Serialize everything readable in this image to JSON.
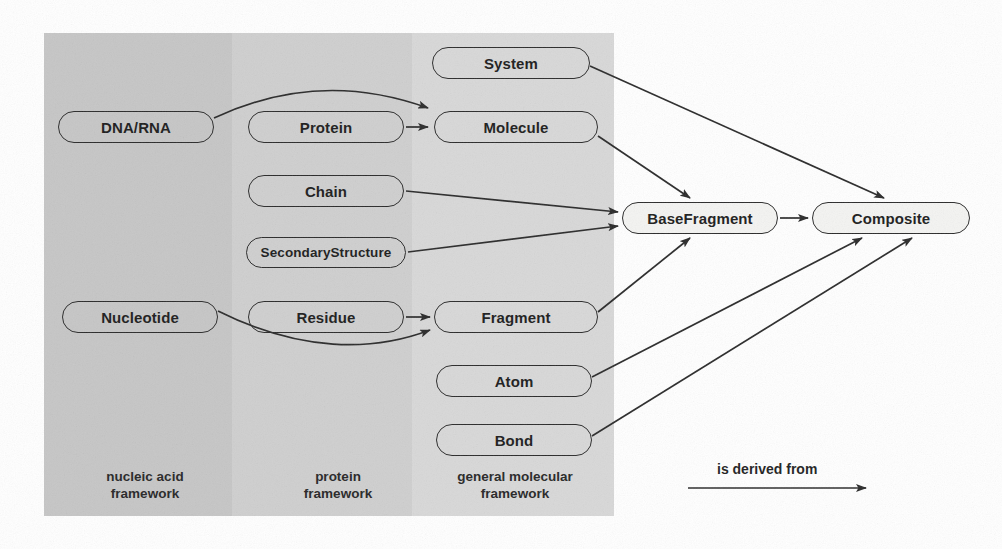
{
  "figure": {
    "kind": "uml-class-hierarchy-diagram",
    "background_color": "#ffffff"
  },
  "bands": [
    {
      "id": "nucleic-acid",
      "label": "nucleic acid\nframework",
      "color": "#c6c6c6",
      "x": 44,
      "y": 33,
      "width": 188,
      "height": 483,
      "label_x": 62,
      "label_y": 468
    },
    {
      "id": "protein",
      "label": "protein\nframework",
      "color": "#cfcfcf",
      "x": 232,
      "y": 33,
      "width": 180,
      "height": 483,
      "label_x": 268,
      "label_y": 468
    },
    {
      "id": "general-molecular",
      "label": "general molecular\nframework",
      "color": "#d8d8d8",
      "x": 412,
      "y": 33,
      "width": 202,
      "height": 483,
      "label_x": 420,
      "label_y": 468
    }
  ],
  "nodes": [
    {
      "id": "system",
      "label": "System",
      "band": "general-molecular",
      "fill": "shaded",
      "x": 432,
      "y": 47,
      "width": 158,
      "height": 32,
      "font_size": 15
    },
    {
      "id": "dna-rna",
      "label": "DNA/RNA",
      "band": "nucleic-acid",
      "fill": "shaded",
      "x": 58,
      "y": 111,
      "width": 156,
      "height": 32,
      "font_size": 15
    },
    {
      "id": "protein",
      "label": "Protein",
      "band": "protein",
      "fill": "shaded",
      "x": 248,
      "y": 111,
      "width": 156,
      "height": 32,
      "font_size": 15
    },
    {
      "id": "molecule",
      "label": "Molecule",
      "band": "general-molecular",
      "fill": "shaded",
      "x": 434,
      "y": 111,
      "width": 164,
      "height": 32,
      "font_size": 15
    },
    {
      "id": "chain",
      "label": "Chain",
      "band": "protein",
      "fill": "shaded",
      "x": 248,
      "y": 175,
      "width": 156,
      "height": 32,
      "font_size": 15
    },
    {
      "id": "secondary-structure",
      "label": "SecondaryStructure",
      "band": "protein",
      "fill": "shaded",
      "x": 246,
      "y": 237,
      "width": 160,
      "height": 31,
      "font_size": 13.5
    },
    {
      "id": "nucleotide",
      "label": "Nucleotide",
      "band": "nucleic-acid",
      "fill": "shaded",
      "x": 62,
      "y": 301,
      "width": 156,
      "height": 32,
      "font_size": 15
    },
    {
      "id": "residue",
      "label": "Residue",
      "band": "protein",
      "fill": "shaded",
      "x": 248,
      "y": 301,
      "width": 156,
      "height": 32,
      "font_size": 15
    },
    {
      "id": "fragment",
      "label": "Fragment",
      "band": "general-molecular",
      "fill": "shaded",
      "x": 434,
      "y": 301,
      "width": 164,
      "height": 32,
      "font_size": 15
    },
    {
      "id": "atom",
      "label": "Atom",
      "band": "general-molecular",
      "fill": "shaded",
      "x": 436,
      "y": 365,
      "width": 156,
      "height": 32,
      "font_size": 15
    },
    {
      "id": "bond",
      "label": "Bond",
      "band": "general-molecular",
      "fill": "shaded",
      "x": 436,
      "y": 424,
      "width": 156,
      "height": 32,
      "font_size": 15
    },
    {
      "id": "base-fragment",
      "label": "BaseFragment",
      "band": null,
      "fill": "white",
      "x": 622,
      "y": 202,
      "width": 156,
      "height": 32,
      "font_size": 15
    },
    {
      "id": "composite",
      "label": "Composite",
      "band": null,
      "fill": "white",
      "x": 812,
      "y": 202,
      "width": 158,
      "height": 32,
      "font_size": 15
    }
  ],
  "edges": [
    {
      "id": "dna-rna-to-molecule",
      "from": "dna-rna",
      "to": "molecule",
      "style": "curved"
    },
    {
      "id": "protein-to-molecule",
      "from": "protein",
      "to": "molecule",
      "style": "straight"
    },
    {
      "id": "chain-to-base-fragment",
      "from": "chain",
      "to": "base-fragment",
      "style": "straight"
    },
    {
      "id": "secondary-structure-to-base-fragment",
      "from": "secondary-structure",
      "to": "base-fragment",
      "style": "straight"
    },
    {
      "id": "nucleotide-to-fragment",
      "from": "nucleotide",
      "to": "fragment",
      "style": "curved"
    },
    {
      "id": "residue-to-fragment",
      "from": "residue",
      "to": "fragment",
      "style": "straight"
    },
    {
      "id": "system-to-composite",
      "from": "system",
      "to": "composite",
      "style": "straight"
    },
    {
      "id": "molecule-to-base-fragment",
      "from": "molecule",
      "to": "base-fragment",
      "style": "straight"
    },
    {
      "id": "fragment-to-base-fragment",
      "from": "fragment",
      "to": "base-fragment",
      "style": "straight"
    },
    {
      "id": "base-fragment-to-composite",
      "from": "base-fragment",
      "to": "composite",
      "style": "straight"
    },
    {
      "id": "atom-to-composite",
      "from": "atom",
      "to": "composite",
      "style": "straight"
    },
    {
      "id": "bond-to-composite",
      "from": "bond",
      "to": "composite",
      "style": "straight"
    }
  ],
  "legend": {
    "label": "is derived from",
    "label_x": 717,
    "label_y": 461,
    "arrow_x1": 688,
    "arrow_y1": 488,
    "arrow_x2": 866,
    "arrow_y2": 488
  },
  "colors": {
    "stroke": "#2a2a2a",
    "text": "#1c1c1c",
    "band_light": "#d8d8d8",
    "band_mid": "#cfcfcf",
    "band_dark": "#c6c6c6",
    "node_white_fill": "#f4f4f2"
  }
}
